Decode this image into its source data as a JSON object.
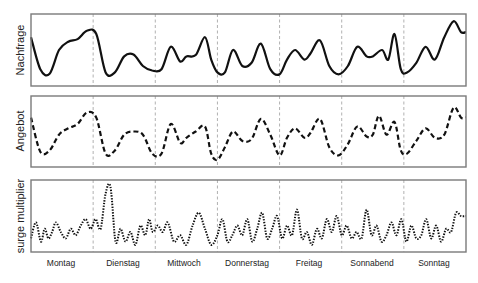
{
  "chart_data": {
    "type": "line",
    "title": "",
    "layout": "three vertically stacked panels sharing a weekday x-axis; dashed vertical separators between days; no numeric ticks",
    "grid": false,
    "legend": null,
    "xlabel": "",
    "categories": [
      "Montag",
      "Dienstag",
      "Mittwoch",
      "Donnerstag",
      "Freitag",
      "Sonnabend",
      "Sonntag"
    ],
    "xlim": [
      0,
      7
    ],
    "ylim": [
      0,
      1
    ],
    "panels": [
      {
        "ylabel": "Nachfrage",
        "line_style": "solid",
        "series_name": "Nachfrage",
        "x": [
          0.0,
          0.15,
          0.3,
          0.45,
          0.6,
          0.75,
          0.9,
          1.05,
          1.2,
          1.35,
          1.5,
          1.65,
          1.8,
          1.95,
          2.1,
          2.25,
          2.4,
          2.5,
          2.65,
          2.8,
          2.9,
          3.0,
          3.12,
          3.25,
          3.4,
          3.55,
          3.7,
          3.85,
          4.0,
          4.12,
          4.25,
          4.4,
          4.5,
          4.65,
          4.8,
          4.95,
          5.1,
          5.25,
          5.4,
          5.5,
          5.65,
          5.75,
          5.85,
          5.95,
          6.05,
          6.2,
          6.35,
          6.5,
          6.65,
          6.8,
          6.92,
          7.0
        ],
        "values": [
          0.7,
          0.2,
          0.13,
          0.5,
          0.63,
          0.67,
          0.8,
          0.75,
          0.15,
          0.15,
          0.4,
          0.43,
          0.25,
          0.18,
          0.2,
          0.55,
          0.32,
          0.4,
          0.42,
          0.7,
          0.35,
          0.15,
          0.15,
          0.5,
          0.25,
          0.3,
          0.6,
          0.2,
          0.12,
          0.35,
          0.5,
          0.35,
          0.45,
          0.65,
          0.25,
          0.12,
          0.25,
          0.55,
          0.4,
          0.4,
          0.5,
          0.35,
          0.75,
          0.2,
          0.15,
          0.3,
          0.55,
          0.35,
          0.7,
          0.95,
          0.78,
          0.78
        ]
      },
      {
        "ylabel": "Angebot",
        "line_style": "dashed",
        "series_name": "Angebot",
        "x": [
          0.0,
          0.15,
          0.3,
          0.45,
          0.6,
          0.75,
          0.9,
          1.05,
          1.2,
          1.35,
          1.5,
          1.65,
          1.8,
          1.95,
          2.1,
          2.25,
          2.4,
          2.5,
          2.65,
          2.8,
          2.9,
          3.0,
          3.12,
          3.25,
          3.4,
          3.55,
          3.7,
          3.85,
          4.0,
          4.12,
          4.25,
          4.4,
          4.5,
          4.65,
          4.8,
          4.95,
          5.1,
          5.25,
          5.4,
          5.5,
          5.6,
          5.72,
          5.85,
          5.95,
          6.05,
          6.2,
          6.35,
          6.5,
          6.65,
          6.8,
          6.92,
          7.0
        ],
        "values": [
          0.72,
          0.18,
          0.2,
          0.45,
          0.55,
          0.62,
          0.8,
          0.72,
          0.15,
          0.2,
          0.45,
          0.5,
          0.45,
          0.15,
          0.15,
          0.62,
          0.32,
          0.4,
          0.5,
          0.58,
          0.15,
          0.05,
          0.25,
          0.5,
          0.35,
          0.38,
          0.7,
          0.45,
          0.12,
          0.4,
          0.55,
          0.4,
          0.48,
          0.7,
          0.25,
          0.12,
          0.3,
          0.58,
          0.42,
          0.45,
          0.75,
          0.45,
          0.65,
          0.2,
          0.15,
          0.35,
          0.55,
          0.4,
          0.45,
          0.88,
          0.72,
          0.72
        ]
      },
      {
        "ylabel": "surge multiplier",
        "line_style": "dotted",
        "series_name": "surge multiplier",
        "x": [
          0.0,
          0.08,
          0.16,
          0.22,
          0.28,
          0.34,
          0.4,
          0.48,
          0.56,
          0.64,
          0.72,
          0.8,
          0.88,
          0.96,
          1.04,
          1.12,
          1.2,
          1.28,
          1.36,
          1.44,
          1.52,
          1.6,
          1.68,
          1.76,
          1.84,
          1.9,
          1.96,
          2.04,
          2.12,
          2.2,
          2.3,
          2.4,
          2.5,
          2.6,
          2.7,
          2.8,
          2.9,
          3.0,
          3.08,
          3.16,
          3.24,
          3.32,
          3.4,
          3.48,
          3.56,
          3.64,
          3.72,
          3.8,
          3.88,
          3.96,
          4.04,
          4.12,
          4.2,
          4.28,
          4.36,
          4.44,
          4.52,
          4.6,
          4.68,
          4.76,
          4.84,
          4.92,
          5.0,
          5.08,
          5.16,
          5.24,
          5.32,
          5.4,
          5.48,
          5.56,
          5.64,
          5.72,
          5.8,
          5.88,
          5.96,
          6.04,
          6.12,
          6.2,
          6.28,
          6.36,
          6.44,
          6.52,
          6.6,
          6.68,
          6.76,
          6.84,
          6.92,
          7.0
        ],
        "values": [
          0.15,
          0.4,
          0.1,
          0.3,
          0.15,
          0.25,
          0.4,
          0.25,
          0.15,
          0.3,
          0.2,
          0.35,
          0.45,
          0.3,
          0.45,
          0.3,
          0.85,
          0.95,
          0.1,
          0.3,
          0.1,
          0.25,
          0.05,
          0.35,
          0.2,
          0.45,
          0.25,
          0.35,
          0.25,
          0.4,
          0.1,
          0.2,
          0.05,
          0.35,
          0.55,
          0.3,
          0.05,
          0.2,
          0.45,
          0.1,
          0.2,
          0.35,
          0.2,
          0.45,
          0.1,
          0.3,
          0.55,
          0.15,
          0.3,
          0.5,
          0.15,
          0.35,
          0.2,
          0.6,
          0.15,
          0.25,
          0.05,
          0.3,
          0.15,
          0.45,
          0.25,
          0.5,
          0.2,
          0.35,
          0.15,
          0.25,
          0.15,
          0.6,
          0.2,
          0.35,
          0.1,
          0.2,
          0.4,
          0.2,
          0.45,
          0.1,
          0.35,
          0.15,
          0.2,
          0.45,
          0.15,
          0.35,
          0.1,
          0.3,
          0.25,
          0.55,
          0.5,
          0.5
        ]
      }
    ]
  },
  "figure": {
    "x_axis_labels": [
      "Montag",
      "Dienstag",
      "Mittwoch",
      "Donnerstag",
      "Freitag",
      "Sonnabend",
      "Sonntag"
    ],
    "panel_labels": [
      "Nachfrage",
      "Angebot",
      "surge multiplier"
    ],
    "colors": {
      "line": "#111111",
      "frame": "#7a7a7a",
      "divider": "#a8a8a8",
      "background": "#ffffff"
    }
  }
}
